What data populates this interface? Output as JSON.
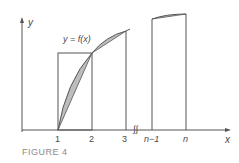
{
  "figure": {
    "caption": "FIGURE 4",
    "curve_label": "y = f(x)",
    "axes": {
      "x_label": "x",
      "y_label": "y"
    },
    "x_ticks": [
      "1",
      "2",
      "3",
      "n−1",
      "n"
    ],
    "break_mark": "∫∫",
    "colors": {
      "line": "#555555",
      "shade": "#bdbdbd",
      "caption": "#8a8a8a"
    }
  }
}
